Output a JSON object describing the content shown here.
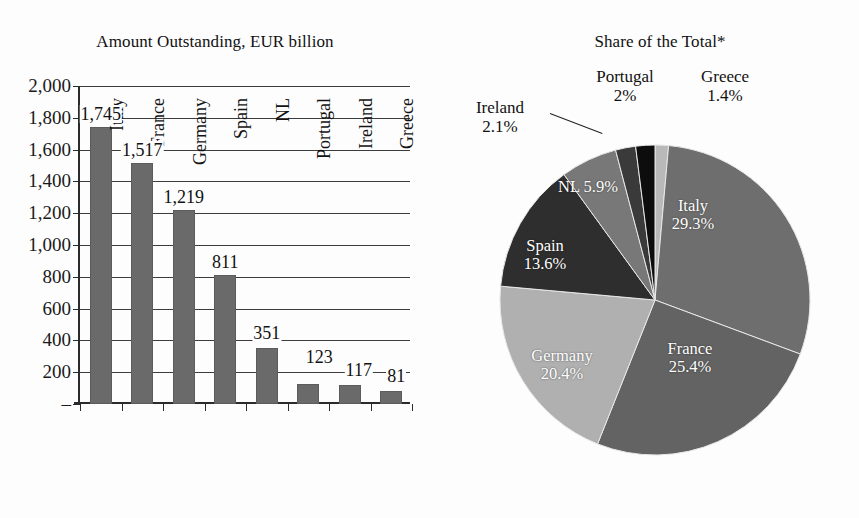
{
  "chart_data": [
    {
      "type": "bar",
      "title": "Amount Outstanding, EUR billion",
      "xlabel": "",
      "ylabel": "",
      "ylim": [
        0,
        2000
      ],
      "grid": true,
      "legend": "none",
      "categories": [
        "Italy",
        "France",
        "Germany",
        "Spain",
        "NL",
        "Portugal",
        "Ireland",
        "Greece"
      ],
      "values": [
        1745,
        1517,
        1219,
        811,
        351,
        123,
        117,
        81
      ],
      "value_labels": [
        "1,745",
        "1,517",
        "1,219",
        "811",
        "351",
        "123",
        "117",
        "81"
      ],
      "ytick_labels": [
        "2,000",
        "1,800",
        "1,600",
        "1,400",
        "1,200",
        "1,000",
        "800",
        "600",
        "400",
        "200",
        "–"
      ],
      "ytick_values": [
        2000,
        1800,
        1600,
        1400,
        1200,
        1000,
        800,
        600,
        400,
        200,
        0
      ],
      "bar_color": "#6a6a6a"
    },
    {
      "type": "pie",
      "title": "Share of the Total*",
      "labels": [
        "Greece",
        "Italy",
        "France",
        "Germany",
        "Spain",
        "NL",
        "Ireland",
        "Portugal"
      ],
      "values": [
        1.4,
        29.3,
        25.4,
        20.4,
        13.6,
        5.9,
        2.1,
        2.0
      ],
      "value_labels": [
        "1.4%",
        "29.3%",
        "25.4%",
        "20.4%",
        "13.6%",
        "5.9%",
        "2.1%",
        "2%"
      ],
      "colors": [
        "#b9b9b9",
        "#6e6e6e",
        "#636363",
        "#b0b0b0",
        "#2e2e2e",
        "#787878",
        "#3a3a3a",
        "#0d0d0d"
      ],
      "start_angle_deg": 0,
      "direction": "clockwise",
      "label_placement": [
        "outside",
        "inside",
        "inside",
        "inside",
        "inside",
        "inside",
        "outside",
        "outside"
      ]
    }
  ],
  "bar_chart": {
    "title": "Amount Outstanding, EUR billion",
    "yticks": [
      {
        "label": "2,000",
        "value": 2000
      },
      {
        "label": "1,800",
        "value": 1800
      },
      {
        "label": "1,600",
        "value": 1600
      },
      {
        "label": "1,400",
        "value": 1400
      },
      {
        "label": "1,200",
        "value": 1200
      },
      {
        "label": "1,000",
        "value": 1000
      },
      {
        "label": "800",
        "value": 800
      },
      {
        "label": "600",
        "value": 600
      },
      {
        "label": "400",
        "value": 400
      },
      {
        "label": "200",
        "value": 200
      },
      {
        "label": "–",
        "value": 0
      }
    ],
    "bars": [
      {
        "category": "Italy",
        "value": 1745,
        "label": "1,745"
      },
      {
        "category": "France",
        "value": 1517,
        "label": "1,517"
      },
      {
        "category": "Germany",
        "value": 1219,
        "label": "1,219"
      },
      {
        "category": "Spain",
        "value": 811,
        "label": "811"
      },
      {
        "category": "NL",
        "value": 351,
        "label": "351"
      },
      {
        "category": "Portugal",
        "value": 123,
        "label": "123"
      },
      {
        "category": "Ireland",
        "value": 117,
        "label": "117"
      },
      {
        "category": "Greece",
        "value": 81,
        "label": "81"
      }
    ]
  },
  "pie_chart": {
    "title": "Share of the Total*",
    "slices": [
      {
        "label": "Greece",
        "pct_label": "1.4%",
        "value": 1.4,
        "color": "#b9b9b9"
      },
      {
        "label": "Italy",
        "pct_label": "29.3%",
        "value": 29.3,
        "color": "#6e6e6e"
      },
      {
        "label": "France",
        "pct_label": "25.4%",
        "value": 25.4,
        "color": "#636363"
      },
      {
        "label": "Germany",
        "pct_label": "20.4%",
        "value": 20.4,
        "color": "#b0b0b0"
      },
      {
        "label": "Spain",
        "pct_label": "13.6%",
        "value": 13.6,
        "color": "#2e2e2e"
      },
      {
        "label": "NL",
        "pct_label": "5.9%",
        "value": 5.9,
        "color": "#787878"
      },
      {
        "label": "Ireland",
        "pct_label": "2.1%",
        "value": 2.1,
        "color": "#3a3a3a"
      },
      {
        "label": "Portugal",
        "pct_label": "2%",
        "value": 2.0,
        "color": "#0d0d0d"
      }
    ],
    "inline_labels": {
      "italy": "Italy",
      "italy_pct": "29.3%",
      "france": "France",
      "france_pct": "25.4%",
      "germany": "Germany",
      "germany_pct": "20.4%",
      "spain": "Spain",
      "spain_pct": "13.6%",
      "nl": "NL 5.9%"
    },
    "outside_labels": {
      "ireland": "Ireland",
      "ireland_pct": "2.1%",
      "portugal": "Portugal",
      "portugal_pct": "2%",
      "greece": "Greece",
      "greece_pct": "1.4%"
    }
  }
}
